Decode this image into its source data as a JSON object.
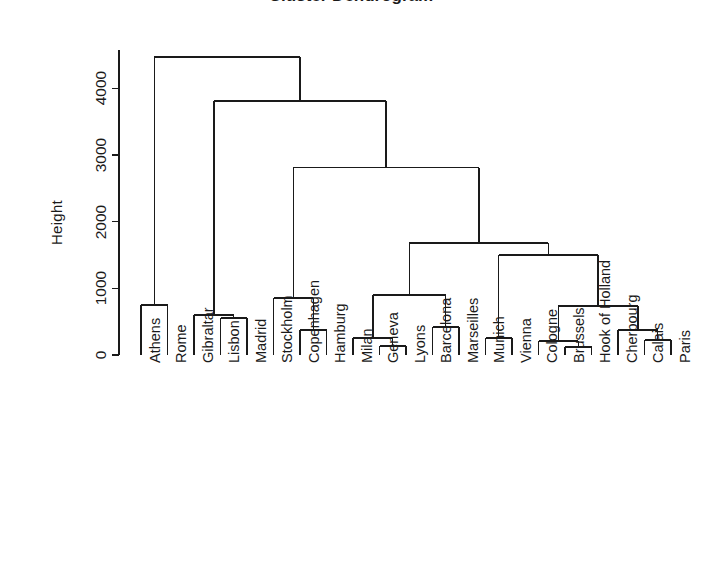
{
  "chart_data": {
    "type": "dendrogram",
    "title": "Cluster Dendrogram",
    "ylabel": "Height",
    "xlabel": "",
    "ylim": [
      0,
      4700
    ],
    "yticks": [
      0,
      1000,
      2000,
      3000,
      4000
    ],
    "ytick_labels": [
      "0",
      "1000",
      "2000",
      "3000",
      "4000"
    ],
    "grid": false,
    "legend": "none",
    "line_color": "#1a1a1a",
    "axis_color": "#1a1a1a",
    "background": "#ffffff",
    "leaf_order": [
      "Athens",
      "Rome",
      "Gibraltar",
      "Lisbon",
      "Madrid",
      "Stockholm",
      "Copenhagen",
      "Hamburg",
      "Milan",
      "Geneva",
      "Lyons",
      "Barcelona",
      "Marseilles",
      "Munich",
      "Vienna",
      "Cologne",
      "Brussels",
      "Hook of Holland",
      "Cherbourg",
      "Calais",
      "Paris"
    ],
    "merges": [
      {
        "id": "m1",
        "left": "Athens",
        "right": "Rome",
        "height": 750
      },
      {
        "id": "m2",
        "left": "Lisbon",
        "right": "Madrid",
        "height": 555
      },
      {
        "id": "m3",
        "left": "Gibraltar",
        "right": "m2",
        "height": 600
      },
      {
        "id": "m4",
        "left": "Copenhagen",
        "right": "Hamburg",
        "height": 375
      },
      {
        "id": "m5",
        "left": "Stockholm",
        "right": "m4",
        "height": 855
      },
      {
        "id": "m6",
        "left": "Geneva",
        "right": "Lyons",
        "height": 135
      },
      {
        "id": "m7",
        "left": "Milan",
        "right": "m6",
        "height": 255
      },
      {
        "id": "m8",
        "left": "Barcelona",
        "right": "Marseilles",
        "height": 420
      },
      {
        "id": "m9",
        "left": "m7",
        "right": "m8",
        "height": 900
      },
      {
        "id": "m10",
        "left": "Munich",
        "right": "Vienna",
        "height": 255
      },
      {
        "id": "m11",
        "left": "Brussels",
        "right": "Hook of Holland",
        "height": 120
      },
      {
        "id": "m12",
        "left": "Cologne",
        "right": "m11",
        "height": 210
      },
      {
        "id": "m13",
        "left": "Calais",
        "right": "Paris",
        "height": 225
      },
      {
        "id": "m14",
        "left": "Cherbourg",
        "right": "m13",
        "height": 375
      },
      {
        "id": "m15",
        "left": "m12",
        "right": "m14",
        "height": 735
      },
      {
        "id": "m16",
        "left": "m10",
        "right": "m15",
        "height": 1500
      },
      {
        "id": "m17",
        "left": "m9",
        "right": "m16",
        "height": 1680
      },
      {
        "id": "m18",
        "left": "m5",
        "right": "m17",
        "height": 2810
      },
      {
        "id": "m19",
        "left": "m3",
        "right": "m18",
        "height": 3810
      },
      {
        "id": "m20",
        "left": "m1",
        "right": "m19",
        "height": 4470
      }
    ]
  },
  "geometry": {
    "leaf_x_start": 141,
    "leaf_x_step": 26.5,
    "y_zero_px": 355,
    "px_per_1000": 66.7,
    "axis_top_px": 50,
    "axis_x_px": 119
  }
}
